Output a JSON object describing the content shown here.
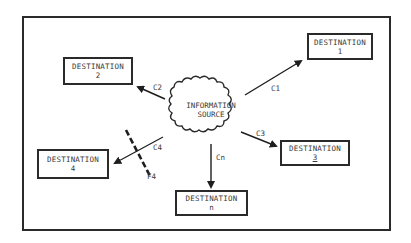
{
  "diagram": {
    "source": {
      "line1": "INFORMATION",
      "line2": "SOURCE"
    },
    "destinations": [
      {
        "id": "1",
        "title": "DESTINATION",
        "sub": "1"
      },
      {
        "id": "2",
        "title": "DESTINATION",
        "sub": "2"
      },
      {
        "id": "3",
        "title": "DESTINATION",
        "sub": "3"
      },
      {
        "id": "4",
        "title": "DESTINATION",
        "sub": "4"
      },
      {
        "id": "n",
        "title": "DESTINATION",
        "sub": "n"
      }
    ],
    "channels": [
      {
        "label": "C1",
        "to": "1"
      },
      {
        "label": "C2",
        "to": "2"
      },
      {
        "label": "C3",
        "to": "3"
      },
      {
        "label": "C4",
        "to": "4"
      },
      {
        "label": "Cn",
        "to": "n"
      }
    ],
    "filter": {
      "label": "F4",
      "on_channel": "C4"
    },
    "colors": {
      "ink": "#2a2a2a",
      "text": "#3a3a3a",
      "background": "#ffffff"
    }
  }
}
